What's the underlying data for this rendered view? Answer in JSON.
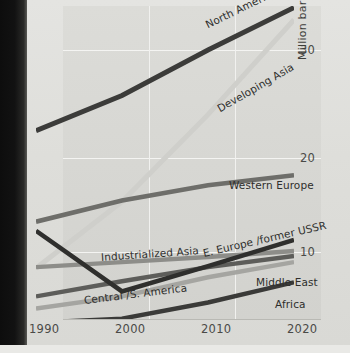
{
  "chart_data": {
    "type": "line",
    "title": "",
    "xlabel": "",
    "ylabel": "Million barrels per day",
    "x": [
      1990,
      2000,
      2010,
      2020
    ],
    "xticklabels": [
      "1990",
      "2000",
      "2010",
      "2020"
    ],
    "yticklabels": [
      "30",
      "20",
      "10"
    ],
    "yticks": [
      30,
      20,
      10
    ],
    "ylim": [
      0,
      36
    ],
    "xlim": [
      1990,
      2020
    ],
    "grid": "both",
    "legend": "inline-series-labels",
    "series": [
      {
        "name": "North America",
        "values": [
          22.0,
          25.5,
          30.0,
          34.2
        ],
        "color": "#3c3c3a",
        "width": 5.0
      },
      {
        "name": "Developing Asia",
        "values": [
          8.4,
          15.0,
          23.6,
          33.0
        ],
        "color": "#cfcfcb",
        "width": 5.0
      },
      {
        "name": "Western Europe",
        "values": [
          13.0,
          15.1,
          16.6,
          17.6
        ],
        "color": "#6e6e6a",
        "width": 4.6
      },
      {
        "name": "E. Europe /former USSR",
        "values": [
          12.1,
          6.1,
          8.6,
          11.2
        ],
        "color": "#2f2f2d",
        "width": 4.6
      },
      {
        "name": "Industrialized Asia",
        "values": [
          8.5,
          9.0,
          9.5,
          10.1
        ],
        "color": "#8d8d89",
        "width": 4.4
      },
      {
        "name": "Central /S. America",
        "values": [
          5.6,
          7.1,
          8.5,
          9.6
        ],
        "color": "#5d5d5a",
        "width": 4.4
      },
      {
        "name": "Middle East",
        "values": [
          4.4,
          5.6,
          7.5,
          9.0
        ],
        "color": "#a5a5a1",
        "width": 4.4
      },
      {
        "name": "Africa",
        "values": [
          3.0,
          3.4,
          5.0,
          7.0
        ],
        "color": "#3a3a38",
        "width": 4.4
      }
    ],
    "series_labels": [
      {
        "name": "North America",
        "text": "North America",
        "rotate": -26
      },
      {
        "name": "Developing Asia",
        "text": "Developing Asia",
        "rotate": -30
      },
      {
        "name": "Western Europe",
        "text": "Western Europe",
        "rotate": 0
      },
      {
        "name": "E. Europe /former USSR",
        "text": "E. Europe /former USSR",
        "rotate": -13
      },
      {
        "name": "Industrialized Asia",
        "text": "Industrialized Asia",
        "rotate": -4
      },
      {
        "name": "Central /S. America",
        "text": "Central /S. America",
        "rotate": -7
      },
      {
        "name": "Middle East",
        "text": "Middle East",
        "rotate": 0
      },
      {
        "name": "Africa",
        "text": "Africa",
        "rotate": 0
      }
    ]
  }
}
